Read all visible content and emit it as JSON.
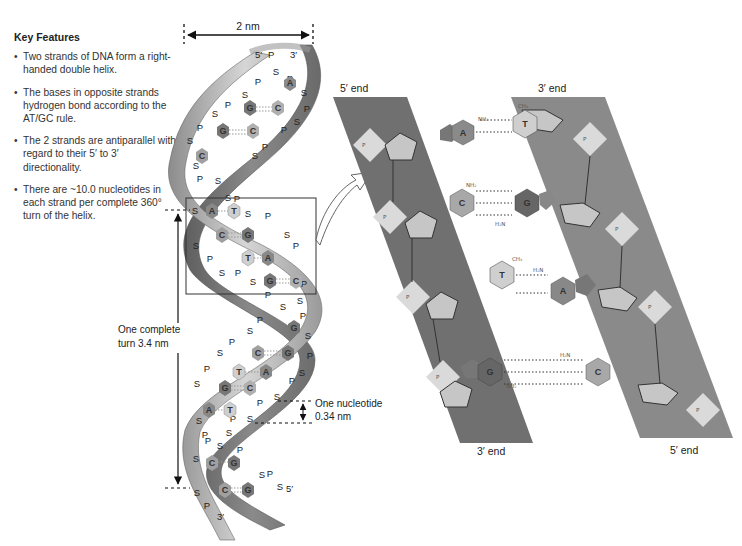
{
  "key_features": {
    "title": "Key Features",
    "bullets": [
      "Two strands of DNA form a right-handed double helix.",
      "The bases in opposite strands hydrogen bond according to the AT/GC rule.",
      "The 2 strands are antiparallel with regard to their 5′ to 3′ directionality.",
      "There are ~10.0 nucleotides in each strand per complete 360° turn of the helix."
    ]
  },
  "helix": {
    "width_label": "2 nm",
    "top_strand_5": "5′",
    "top_strand_3": "3′",
    "bottom_strand_5": "5′",
    "bottom_strand_3": "3′",
    "turn_label_1": "One complete",
    "turn_label_2": "turn 3.4 nm",
    "nucleotide_label_1": "One nucleotide",
    "nucleotide_label_2": "0.34 nm",
    "backbone_P": "P",
    "backbone_S": "S",
    "base_pairs": [
      {
        "left": "",
        "right": "A"
      },
      {
        "left": "G",
        "right": "C"
      },
      {
        "left": "G",
        "right": "C"
      },
      {
        "left": "C",
        "right": ""
      },
      {
        "left": "A",
        "right": "T"
      },
      {
        "left": "C",
        "right": "G"
      },
      {
        "left": "T",
        "right": "A"
      },
      {
        "left": "G",
        "right": "C"
      },
      {
        "left": "",
        "right": "G"
      },
      {
        "left": "C",
        "right": "G"
      },
      {
        "left": "T",
        "right": "A"
      },
      {
        "left": "G",
        "right": "C"
      },
      {
        "left": "A",
        "right": "T"
      },
      {
        "left": "C",
        "right": "G"
      },
      {
        "left": "C",
        "right": "G"
      }
    ]
  },
  "detail": {
    "left_top_label": "5′ end",
    "right_top_label": "3′ end",
    "left_bottom_label": "3′ end",
    "right_bottom_label": "5′ end",
    "pairs": [
      {
        "left": "A",
        "right": "T",
        "left_type": "purine",
        "right_type": "pyrimidine"
      },
      {
        "left": "C",
        "right": "G",
        "left_type": "pyrimidine",
        "right_type": "purine"
      },
      {
        "left": "T",
        "right": "A",
        "left_type": "pyrimidine",
        "right_type": "purine"
      },
      {
        "left": "G",
        "right": "C",
        "left_type": "purine",
        "right_type": "pyrimidine"
      }
    ],
    "phosphate": {
      "p": "P",
      "o": "O"
    },
    "atoms": {
      "h": "H",
      "n": "N",
      "o": "O",
      "nh2": "NH₂",
      "h2n": "H₂N",
      "ch3": "CH₃",
      "ch2": "CH₂"
    }
  },
  "colors": {
    "band_dark": "#6e6e6e",
    "band_light": "#9a9a9a",
    "ribbon_light": "#c8c8c8",
    "ribbon_dark": "#7a7a7a",
    "sugar": "#c9c9c9",
    "phosphate": "#dcdcdc",
    "base_dark": "#6a6a6a",
    "base_mid": "#8e8e8e",
    "base_light": "#bdbdbd"
  }
}
